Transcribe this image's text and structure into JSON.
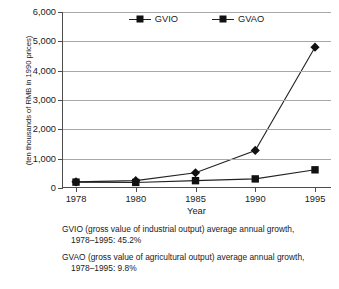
{
  "chart_data": {
    "type": "line",
    "title": "",
    "xlabel": "Year",
    "ylabel": "(ten thousands of RMB in 1990 prices)",
    "categories": [
      "1978",
      "1980",
      "1985",
      "1990",
      "1995"
    ],
    "x_tick_labels": [
      "1978",
      "1980",
      "1985",
      "1990",
      "1995"
    ],
    "y_tick_labels": [
      "0",
      "1,000",
      "2,000",
      "3,000",
      "4,000",
      "5,000",
      "6,000"
    ],
    "y_tick_values": [
      0,
      1000,
      2000,
      3000,
      4000,
      5000,
      6000
    ],
    "ylim": [
      0,
      6000
    ],
    "grid": "horizontal",
    "legend_position": "top-center",
    "series": [
      {
        "name": "GVIO",
        "marker": "diamond",
        "values": [
          210,
          250,
          520,
          1280,
          4800
        ]
      },
      {
        "name": "GVAO",
        "marker": "square",
        "values": [
          200,
          190,
          250,
          310,
          620
        ]
      }
    ]
  },
  "legend": {
    "entries": [
      {
        "label": "GVIO",
        "marker": "diamond-marker"
      },
      {
        "label": "GVAO",
        "marker": "square-marker"
      }
    ]
  },
  "axes": {
    "x_title": "Year",
    "y_title": "(ten thousands of RMB in 1990 prices)"
  },
  "notes": [
    {
      "line1": "GVIO (gross value of industrial output) average annual growth,",
      "line2": "1978–1995: 45.2%"
    },
    {
      "line1": "GVAO (gross value of agricultural output) average annual growth,",
      "line2": "1978–1995: 9.8%"
    }
  ],
  "colors": {
    "series_line": "#222222",
    "marker": "#111111",
    "gridline": "#a8a8a8",
    "axis": "#4d4d4d",
    "text": "#1a1a1a",
    "background": "#ffffff"
  }
}
